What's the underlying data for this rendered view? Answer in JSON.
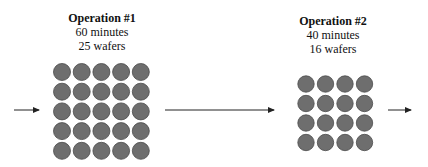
{
  "operations": [
    {
      "title": "Operation #1",
      "duration": "60 minutes",
      "batch": "25 wafers",
      "rows": 5,
      "cols": 5
    },
    {
      "title": "Operation #2",
      "duration": "40 minutes",
      "batch": "16 wafers",
      "rows": 4,
      "cols": 4
    }
  ],
  "colors": {
    "wafer_fill": "#6e6e6e",
    "wafer_stroke": "#4a4a4a",
    "arrow": "#222222"
  }
}
